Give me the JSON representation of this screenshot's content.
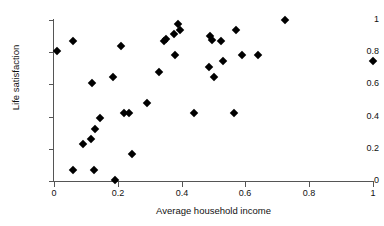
{
  "chart_data": {
    "type": "scatter",
    "title": "",
    "xlabel": "Average household income",
    "ylabel": "Life satisfaction",
    "xlim": [
      0,
      1
    ],
    "ylim": [
      0,
      1
    ],
    "xticks": [
      0,
      0.2,
      0.4,
      0.6,
      0.8,
      1
    ],
    "yticks": [
      0,
      0.2,
      0.4,
      0.6,
      0.8,
      1
    ],
    "xtick_labels": [
      "0",
      "0.2",
      "0.4",
      "0.6",
      "0.8",
      "1"
    ],
    "ytick_labels": [
      "0",
      "0.2",
      "0.4",
      "0.6",
      "0.8",
      "1"
    ],
    "grid": false,
    "legend": null,
    "marker": "diamond",
    "marker_color": "#000000",
    "points": [
      {
        "x": 0.01,
        "y": 0.81
      },
      {
        "x": 0.06,
        "y": 0.87
      },
      {
        "x": 0.06,
        "y": 0.07
      },
      {
        "x": 0.09,
        "y": 0.23
      },
      {
        "x": 0.115,
        "y": 0.26
      },
      {
        "x": 0.12,
        "y": 0.61
      },
      {
        "x": 0.125,
        "y": 0.07
      },
      {
        "x": 0.13,
        "y": 0.325
      },
      {
        "x": 0.145,
        "y": 0.39
      },
      {
        "x": 0.185,
        "y": 0.645
      },
      {
        "x": 0.19,
        "y": 0.005
      },
      {
        "x": 0.21,
        "y": 0.84
      },
      {
        "x": 0.22,
        "y": 0.42
      },
      {
        "x": 0.235,
        "y": 0.42
      },
      {
        "x": 0.245,
        "y": 0.165
      },
      {
        "x": 0.29,
        "y": 0.485
      },
      {
        "x": 0.33,
        "y": 0.68
      },
      {
        "x": 0.345,
        "y": 0.87
      },
      {
        "x": 0.35,
        "y": 0.885
      },
      {
        "x": 0.375,
        "y": 0.91
      },
      {
        "x": 0.38,
        "y": 0.78
      },
      {
        "x": 0.39,
        "y": 0.975
      },
      {
        "x": 0.395,
        "y": 0.94
      },
      {
        "x": 0.44,
        "y": 0.42
      },
      {
        "x": 0.485,
        "y": 0.71
      },
      {
        "x": 0.49,
        "y": 0.9
      },
      {
        "x": 0.495,
        "y": 0.875
      },
      {
        "x": 0.5,
        "y": 0.645
      },
      {
        "x": 0.525,
        "y": 0.87
      },
      {
        "x": 0.53,
        "y": 0.745
      },
      {
        "x": 0.565,
        "y": 0.42
      },
      {
        "x": 0.57,
        "y": 0.94
      },
      {
        "x": 0.59,
        "y": 0.78
      },
      {
        "x": 0.64,
        "y": 0.78
      },
      {
        "x": 0.725,
        "y": 1.0
      },
      {
        "x": 1.0,
        "y": 0.745
      }
    ]
  }
}
